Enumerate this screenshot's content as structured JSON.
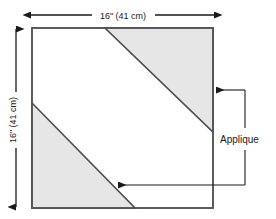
{
  "diagram": {
    "colors": {
      "background": "#ffffff",
      "outline": "#555555",
      "applique_fill": "#e6e6e6",
      "applique_edge": "#4d4d4d",
      "dimension_line": "#1a1a1a",
      "leader_line": "#1a1a1a",
      "text": "#1a1a1a"
    },
    "block": {
      "name": "fabric-square",
      "width_label": "16\" (41 cm)",
      "height_label": "16\" (41 cm)"
    },
    "dimensions": [
      {
        "id": "top-width",
        "label": "16\" (41 cm)",
        "orientation": "horizontal",
        "arrow_style": "double-headed"
      },
      {
        "id": "left-height",
        "label": "16\" (41 cm)",
        "orientation": "vertical",
        "arrow_style": "double-headed"
      }
    ],
    "callouts": [
      {
        "id": "applique-callout",
        "label": "Applique",
        "targets": [
          "upper-right-applique-triangle",
          "lower-left-applique-triangle"
        ],
        "arrow_count": 2
      }
    ],
    "shapes": [
      {
        "id": "upper-right-applique-triangle",
        "name": "Applique",
        "position": "upper-right",
        "fill": "#e6e6e6"
      },
      {
        "id": "lower-left-applique-triangle",
        "name": "Applique",
        "position": "lower-left",
        "fill": "#e6e6e6"
      }
    ]
  }
}
